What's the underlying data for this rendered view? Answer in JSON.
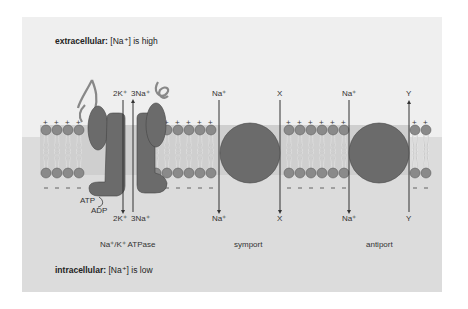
{
  "diagram": {
    "extracellular": {
      "bold": "extracellular:",
      "text": " [Na⁺] is high"
    },
    "intracellular": {
      "bold": "intracellular:",
      "text": " [Na⁺] is low"
    },
    "pump": {
      "name": "Na⁺/K⁺ ATPase",
      "top_labels": [
        "2K⁺",
        "3Na⁺"
      ],
      "bottom_labels": [
        "2K⁺",
        "3Na⁺"
      ],
      "atp": "ATP",
      "adp": "ADP"
    },
    "symport": {
      "name": "symport",
      "top_labels": [
        "Na⁺",
        "X"
      ],
      "bottom_labels": [
        "Na⁺",
        "X"
      ]
    },
    "antiport": {
      "name": "antiport",
      "top_labels": [
        "Na⁺",
        "Y"
      ],
      "bottom_labels": [
        "Na⁺",
        "Y"
      ]
    },
    "charges": {
      "outer": "+",
      "inner": "−"
    },
    "colors": {
      "protein": "#6b6b6b",
      "lipid_head": "#8a8a8a",
      "outside": "#efefef",
      "inside": "#dcdcdc",
      "arrow": "#333333"
    }
  }
}
